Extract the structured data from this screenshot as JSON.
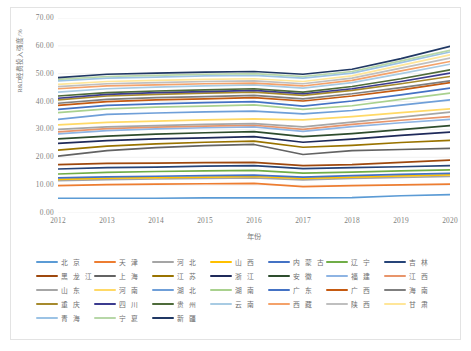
{
  "chart_data": {
    "type": "line",
    "title": "",
    "xlabel": "年份",
    "ylabel": "R&D经费投入强度/%",
    "x": [
      2012,
      2013,
      2014,
      2015,
      2016,
      2017,
      2018,
      2019,
      2020
    ],
    "xlim": [
      2012,
      2020
    ],
    "ylim": [
      0,
      70
    ],
    "yticks": [
      "0.00",
      "10.00",
      "20.00",
      "30.00",
      "40.00",
      "50.00",
      "60.00",
      "70.00"
    ],
    "ytick_values": [
      0,
      10,
      20,
      30,
      40,
      50,
      60,
      70
    ],
    "xticks": [
      "2012",
      "2013",
      "2014",
      "2015",
      "2016",
      "2017",
      "2018",
      "2019",
      "2020"
    ],
    "grid": "horizontal-light",
    "legend_position": "bottom",
    "legend_columns": 7,
    "series": [
      {
        "name": "北  京",
        "color": "#5b9bd5",
        "values": [
          5.3,
          5.3,
          5.3,
          5.4,
          5.4,
          5.4,
          5.5,
          6.2,
          6.6
        ]
      },
      {
        "name": "天  津",
        "color": "#ed7d31",
        "values": [
          9.8,
          10.2,
          10.4,
          10.5,
          10.6,
          9.5,
          9.8,
          10.1,
          10.4
        ]
      },
      {
        "name": "河  北",
        "color": "#a5a5a5",
        "values": [
          11.6,
          12.0,
          12.2,
          12.4,
          12.6,
          11.9,
          12.4,
          12.8,
          13.1
        ]
      },
      {
        "name": "山  西",
        "color": "#ffc000",
        "values": [
          12.1,
          12.5,
          12.7,
          12.9,
          13.1,
          12.4,
          12.9,
          13.3,
          13.7
        ]
      },
      {
        "name": "内 蒙 古",
        "color": "#4472c4",
        "values": [
          12.6,
          13.0,
          13.2,
          13.4,
          13.6,
          12.9,
          13.4,
          13.9,
          14.2
        ]
      },
      {
        "name": "辽  宁",
        "color": "#70ad47",
        "values": [
          14.0,
          14.6,
          14.9,
          15.1,
          15.3,
          14.3,
          14.7,
          15.1,
          15.5
        ]
      },
      {
        "name": "吉  林",
        "color": "#264478",
        "values": [
          15.8,
          16.3,
          16.5,
          16.8,
          17.0,
          15.9,
          16.3,
          16.6,
          17.0
        ]
      },
      {
        "name": "黑 龙 江",
        "color": "#9e480e",
        "values": [
          17.4,
          17.8,
          17.9,
          18.1,
          18.2,
          17.0,
          17.4,
          18.2,
          19.0
        ]
      },
      {
        "name": "上  海",
        "color": "#636363",
        "values": [
          20.4,
          22.4,
          23.5,
          24.2,
          24.6,
          21.0,
          22.4,
          22.8,
          23.2
        ]
      },
      {
        "name": "江  苏",
        "color": "#997300",
        "values": [
          22.6,
          24.0,
          24.8,
          25.4,
          25.8,
          23.6,
          24.3,
          25.3,
          26.1
        ]
      },
      {
        "name": "浙  江",
        "color": "#1f2a5a",
        "values": [
          25.0,
          26.0,
          26.6,
          27.0,
          27.4,
          25.4,
          26.5,
          27.9,
          29.0
        ]
      },
      {
        "name": "安  徽",
        "color": "#2e4d2e",
        "values": [
          26.6,
          27.6,
          28.3,
          28.8,
          29.2,
          27.4,
          28.5,
          29.9,
          31.4
        ]
      },
      {
        "name": "福  建",
        "color": "#8eb4e3",
        "values": [
          28.4,
          29.6,
          30.2,
          30.6,
          30.9,
          29.3,
          31.0,
          32.4,
          33.6
        ]
      },
      {
        "name": "江  西",
        "color": "#e8956b",
        "values": [
          29.1,
          30.3,
          30.8,
          31.2,
          31.5,
          30.0,
          31.8,
          33.3,
          34.6
        ]
      },
      {
        "name": "山  东",
        "color": "#a6a6a6",
        "values": [
          30.0,
          30.9,
          31.4,
          31.8,
          32.1,
          30.9,
          32.6,
          34.4,
          36.2
        ]
      },
      {
        "name": "河  南",
        "color": "#ffd966",
        "values": [
          31.6,
          32.5,
          33.0,
          33.4,
          33.8,
          33.4,
          34.6,
          36.0,
          37.4
        ]
      },
      {
        "name": "湖  北",
        "color": "#6f9fd8",
        "values": [
          33.6,
          35.4,
          35.9,
          36.3,
          36.6,
          35.6,
          36.8,
          38.7,
          40.6
        ]
      },
      {
        "name": "湖  南",
        "color": "#a9d18e",
        "values": [
          36.0,
          37.4,
          38.0,
          38.4,
          38.8,
          37.2,
          38.5,
          40.8,
          43.0
        ]
      },
      {
        "name": "广  东",
        "color": "#4472c4",
        "values": [
          37.2,
          38.6,
          39.2,
          39.6,
          40.0,
          38.4,
          40.2,
          42.4,
          44.8
        ]
      },
      {
        "name": "广  西",
        "color": "#c55a11",
        "values": [
          38.6,
          40.0,
          40.6,
          41.0,
          41.4,
          40.2,
          42.0,
          44.2,
          46.8
        ]
      },
      {
        "name": "海  南",
        "color": "#7f7f7f",
        "values": [
          39.4,
          40.8,
          41.4,
          41.8,
          42.2,
          41.0,
          42.8,
          45.0,
          47.4
        ]
      },
      {
        "name": "重  庆",
        "color": "#a68a2d",
        "values": [
          40.6,
          42.0,
          42.6,
          43.0,
          43.4,
          42.2,
          44.0,
          46.4,
          49.0
        ]
      },
      {
        "name": "四  川",
        "color": "#3b3b8f",
        "values": [
          41.2,
          42.6,
          43.2,
          43.6,
          44.0,
          42.8,
          44.6,
          47.2,
          50.2
        ]
      },
      {
        "name": "贵  州",
        "color": "#4e6b3a",
        "values": [
          42.0,
          43.2,
          43.8,
          44.2,
          44.6,
          43.4,
          45.4,
          48.2,
          51.4
        ]
      },
      {
        "name": "云  南",
        "color": "#a8cbe3",
        "values": [
          43.4,
          44.6,
          45.2,
          45.6,
          46.0,
          44.8,
          46.8,
          50.0,
          53.4
        ]
      },
      {
        "name": "西  藏",
        "color": "#f4a26a",
        "values": [
          44.6,
          45.6,
          46.0,
          46.4,
          46.6,
          45.6,
          47.6,
          51.0,
          54.4
        ]
      },
      {
        "name": "陕  西",
        "color": "#bfbfbf",
        "values": [
          45.4,
          46.4,
          46.8,
          47.2,
          47.4,
          46.4,
          48.4,
          52.0,
          55.6
        ]
      },
      {
        "name": "甘  肃",
        "color": "#ffe699",
        "values": [
          46.2,
          47.2,
          47.6,
          48.0,
          48.2,
          47.2,
          49.2,
          53.0,
          56.8
        ]
      },
      {
        "name": "青  海",
        "color": "#9cc3e5",
        "values": [
          47.4,
          48.4,
          48.8,
          49.2,
          49.4,
          48.4,
          50.2,
          54.0,
          57.8
        ]
      },
      {
        "name": "宁  夏",
        "color": "#b7d7a8",
        "values": [
          48.0,
          49.0,
          49.4,
          49.8,
          50.0,
          49.0,
          50.8,
          54.6,
          58.4
        ]
      },
      {
        "name": "新  疆",
        "color": "#203864",
        "values": [
          48.6,
          49.8,
          50.2,
          50.6,
          50.8,
          49.8,
          51.6,
          55.4,
          59.8
        ]
      }
    ]
  },
  "legend": {
    "rows": [
      [
        "北  京",
        "天  津",
        "河  北",
        "山  西",
        "内 蒙 古",
        "辽  宁",
        "吉  林"
      ],
      [
        "黑 龙 江",
        "上  海",
        "江  苏",
        "浙  江",
        "安  徽",
        "福  建",
        "江  西"
      ],
      [
        "山  东",
        "河  南",
        "湖  北",
        "湖  南",
        "广  东",
        "广  西",
        "海  南"
      ],
      [
        "重  庆",
        "四  川",
        "贵  州",
        "云  南",
        "西  藏",
        "陕  西",
        "甘  肃"
      ],
      [
        "青  海",
        "宁  夏",
        "新  疆"
      ]
    ]
  }
}
